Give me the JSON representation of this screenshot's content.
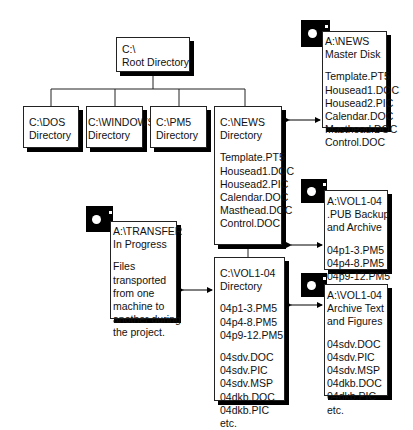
{
  "root": {
    "path": "C:\\",
    "label": "Root Directory"
  },
  "directories": [
    {
      "id": "dos",
      "path": "C:\\DOS",
      "label": "Directory"
    },
    {
      "id": "windows",
      "path": "C:\\WINDOWS",
      "label": "Directory"
    },
    {
      "id": "pm5",
      "path": "C:\\PM5",
      "label": "Directory"
    }
  ],
  "news": {
    "path": "C:\\NEWS",
    "label": "Directory",
    "files": [
      "Template.PT5",
      "Housead1.DOC",
      "Housead2.PIC",
      "Calendar.DOC",
      "Masthead.DOC",
      "Control.DOC"
    ]
  },
  "vol": {
    "path": "C:\\VOL1-04",
    "label": "Directory",
    "files_group1": [
      "04p1-3.PM5",
      "04p4-8.PM5",
      "04p9-12.PM5"
    ],
    "files_group2": [
      "04sdv.DOC",
      "04sdv.PIC",
      "04sdv.MSP",
      "04dkb.DOC",
      "04dkb.PIC",
      "etc."
    ]
  },
  "disk_news": {
    "path": "A:\\NEWS",
    "label": "Master Disk",
    "files": [
      "Template.PT5",
      "Housead1.DOC",
      "Housead2.PIC",
      "Calendar.DOC",
      "Masthead.DOC",
      "Control.DOC"
    ]
  },
  "disk_pub": {
    "path": "A:\\VOL1-04",
    "label1": ".PUB Backup",
    "label2": "and Archive",
    "files": [
      "04p1-3.PM5",
      "04p4-8.PM5",
      "04p9-12.PM5"
    ]
  },
  "disk_archive": {
    "path": "A:\\VOL1-04",
    "label1": "Archive Text",
    "label2": "and Figures",
    "files": [
      "04sdv.DOC",
      "04sdv.PIC",
      "04sdv.MSP",
      "04dkb.DOC",
      "04dkb.PIC",
      "etc."
    ]
  },
  "disk_transfer": {
    "path": "A:\\TRANSFER",
    "label": "In Progress",
    "description": [
      "Files",
      "transported",
      "from one",
      "machine to",
      "another during",
      "the project."
    ]
  }
}
